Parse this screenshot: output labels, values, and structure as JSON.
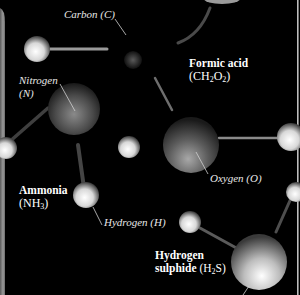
{
  "diagram": {
    "background": "#000000",
    "molecules": [
      {
        "name": "Formic acid",
        "formula_prefix": "(CH",
        "sub1": "2",
        "mid": "O",
        "sub2": "2",
        "suffix": ")"
      },
      {
        "name": "Ammonia",
        "formula_prefix": "(NH",
        "sub1": "3",
        "suffix": ")"
      },
      {
        "name": "Hydrogen",
        "name2": "sulphide",
        "formula_prefix": "(H",
        "sub1": "2",
        "suffix": "S)"
      }
    ],
    "atoms": [
      {
        "label": "Carbon (C)"
      },
      {
        "label_line1": "Nitrogen",
        "label_line2": "(N)"
      },
      {
        "label": "Oxygen (O)"
      },
      {
        "label": "Hydrogen (H)"
      }
    ]
  }
}
